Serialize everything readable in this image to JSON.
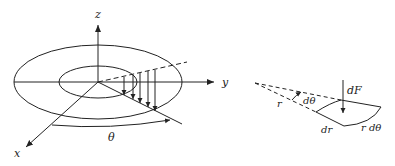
{
  "diagram": {
    "left_figure": {
      "description": "Annular disk in 3D axes with distributed load arrows over a radial strip",
      "axes": {
        "z_label": "z",
        "y_label": "y",
        "x_label": "x"
      },
      "angle_label": "θ",
      "load_arrow_count": 5
    },
    "right_figure": {
      "description": "Differential annular element with force",
      "labels": {
        "force": "dF",
        "radius": "r",
        "angle": "dθ",
        "radial_width": "dr",
        "arc_length": "r dθ"
      }
    },
    "colors": {
      "stroke": "#222222",
      "background": "#ffffff"
    }
  }
}
